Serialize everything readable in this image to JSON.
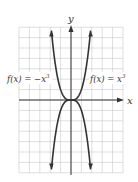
{
  "chart_data": {
    "type": "line",
    "title": "",
    "xlabel": "x",
    "ylabel": "y",
    "xlim": [
      -5,
      5
    ],
    "ylim": [
      -7,
      7
    ],
    "grid": true,
    "grid_step": 1,
    "tick_labels": false,
    "series": [
      {
        "name": "f(x) = x^3",
        "label_text": "f(x) = x",
        "label_exponent": "3",
        "x": [
          -1.91,
          -1.5,
          -1,
          -0.5,
          0,
          0.5,
          1,
          1.5,
          1.91
        ],
        "values": [
          -7,
          -3.375,
          -1,
          -0.125,
          0,
          0.125,
          1,
          3.375,
          7
        ]
      },
      {
        "name": "f(x) = -x^3",
        "label_text": "f(x) = −x",
        "label_exponent": "3",
        "x": [
          -1.91,
          -1.5,
          -1,
          -0.5,
          0,
          0.5,
          1,
          1.5,
          1.91
        ],
        "values": [
          7,
          3.375,
          1,
          0.125,
          0,
          -0.125,
          -1,
          -3.375,
          -7
        ]
      }
    ],
    "legend_position": "inline annotations"
  },
  "labels": {
    "x_axis": "x",
    "y_axis": "y",
    "left_curve": "f(x) = −x",
    "left_exp": "3",
    "right_curve": "f(x) = x",
    "right_exp": "3"
  },
  "colors": {
    "curve": "#333333",
    "grid": "#c8c8c8",
    "background": "#ffffff"
  }
}
